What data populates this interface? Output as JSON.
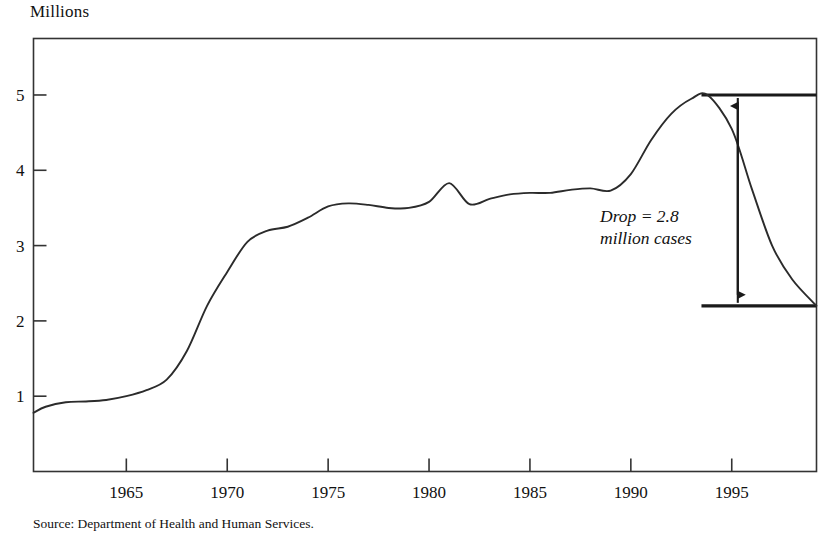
{
  "figure": {
    "axis_title": "Millions",
    "source_note": "Source: Department of Health and Human Services.",
    "line_color": "#2b2b2b",
    "border_color": "#333333",
    "background": "#ffffff"
  },
  "annotation": {
    "line1": "Drop = 2.8",
    "line2": "million cases",
    "arrow_top_value": 5.0,
    "arrow_bottom_value": 2.2,
    "ref_line_high": 5.0,
    "ref_line_low": 2.2,
    "ref_line_start_year": 1993.5
  },
  "chart_data": {
    "type": "line",
    "title": "",
    "subtitle": "",
    "xlabel": "",
    "ylabel": "Millions",
    "xlim": [
      1960.4,
      1999.2
    ],
    "ylim": [
      0,
      5.75
    ],
    "grid": false,
    "legend": null,
    "xticks": [
      1965,
      1970,
      1975,
      1980,
      1985,
      1990,
      1995
    ],
    "xtick_labels": [
      "1965",
      "1970",
      "1975",
      "1980",
      "1985",
      "1990",
      "1995"
    ],
    "yticks": [
      1,
      2,
      3,
      4,
      5
    ],
    "ytick_labels": [
      "1",
      "2",
      "3",
      "4",
      "5"
    ],
    "series": [
      {
        "name": "Cases",
        "x": [
          1960.4,
          1961,
          1962,
          1963,
          1964,
          1965,
          1966,
          1967,
          1968,
          1969,
          1970,
          1971,
          1972,
          1973,
          1974,
          1975,
          1976,
          1977,
          1978,
          1979,
          1980,
          1981,
          1982,
          1983,
          1984,
          1985,
          1986,
          1987,
          1988,
          1989,
          1990,
          1991,
          1992,
          1993,
          1993.8,
          1995,
          1996,
          1997,
          1998,
          1999.2
        ],
        "values": [
          0.78,
          0.86,
          0.92,
          0.93,
          0.95,
          1.0,
          1.08,
          1.22,
          1.6,
          2.2,
          2.65,
          3.05,
          3.2,
          3.25,
          3.37,
          3.52,
          3.56,
          3.54,
          3.5,
          3.5,
          3.58,
          3.83,
          3.55,
          3.62,
          3.68,
          3.7,
          3.7,
          3.74,
          3.76,
          3.73,
          3.95,
          4.4,
          4.75,
          4.95,
          5.0,
          4.55,
          3.75,
          3.0,
          2.55,
          2.2
        ]
      }
    ],
    "annotations": [
      {
        "text": "Drop = 2.8 million cases",
        "x": 1990.5,
        "y": 3.2,
        "style": "italic"
      }
    ],
    "reference_lines": [
      {
        "value": 5.0,
        "from_year": 1993.5,
        "to_year": 1999.2,
        "orientation": "horizontal"
      },
      {
        "value": 2.2,
        "from_year": 1993.5,
        "to_year": 1999.2,
        "orientation": "horizontal"
      }
    ],
    "arrow": {
      "x": 1995.3,
      "y_top": 5.0,
      "y_bottom": 2.2,
      "double_headed": true
    }
  }
}
